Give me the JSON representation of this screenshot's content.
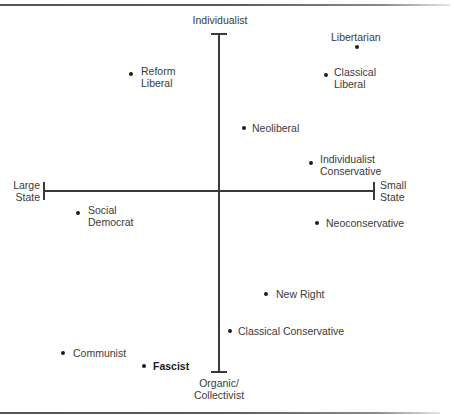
{
  "diagram": {
    "type": "two-axis ideology map",
    "axes": {
      "top": "Individualist",
      "bottom_line1": "Organic/",
      "bottom_line2": "Collectivist",
      "left_line1": "Large",
      "left_line2": "State",
      "right_line1": "Small",
      "right_line2": "State"
    },
    "points": [
      {
        "id": "libertarian",
        "line1": "Libertarian",
        "line2": "",
        "bold": false
      },
      {
        "id": "classical-liberal",
        "line1": "Classical",
        "line2": "Liberal",
        "bold": false
      },
      {
        "id": "reform-liberal",
        "line1": "Reform",
        "line2": "Liberal",
        "bold": false
      },
      {
        "id": "neoliberal",
        "line1": "Neoliberal",
        "line2": "",
        "bold": false
      },
      {
        "id": "individualist-conservative",
        "line1": "Individualist",
        "line2": "Conservative",
        "bold": false
      },
      {
        "id": "social-democrat",
        "line1": "Social",
        "line2": "Democrat",
        "bold": false
      },
      {
        "id": "neoconservative",
        "line1": "Neoconservative",
        "line2": "",
        "bold": false
      },
      {
        "id": "new-right",
        "line1": "New Right",
        "line2": "",
        "bold": false
      },
      {
        "id": "classical-conservative",
        "line1": "Classical Conservative",
        "line2": "",
        "bold": false
      },
      {
        "id": "communist",
        "line1": "Communist",
        "line2": "",
        "bold": false
      },
      {
        "id": "fascist",
        "line1": "Fascist",
        "line2": "",
        "bold": true
      }
    ]
  }
}
